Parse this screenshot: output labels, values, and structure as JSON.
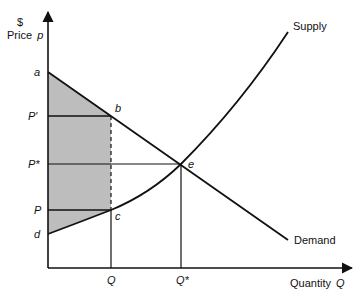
{
  "diagram": {
    "type": "supply-demand",
    "y_axis": {
      "unit": "$",
      "label": "Price",
      "var": "p"
    },
    "x_axis": {
      "label": "Quantity",
      "var": "Q"
    },
    "curves": {
      "supply": "Supply",
      "demand": "Demand"
    },
    "price_labels": {
      "a": "a",
      "p_prime": "P′",
      "p_star": "P*",
      "p": "P",
      "d": "d"
    },
    "quantity_labels": {
      "q": "Q",
      "q_star": "Q*"
    },
    "points": {
      "b": "b",
      "e": "e",
      "c": "c"
    },
    "colors": {
      "line": "#111111",
      "shade": "#bdbdbd",
      "background": "#ffffff"
    }
  }
}
